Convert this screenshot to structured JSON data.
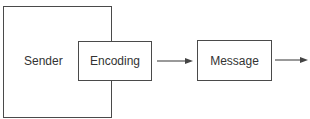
{
  "diagram": {
    "nodes": [
      {
        "id": "sender",
        "label": "Sender"
      },
      {
        "id": "encoding",
        "label": "Encoding"
      },
      {
        "id": "message",
        "label": "Message"
      }
    ],
    "edges": [
      {
        "from": "encoding",
        "to": "message"
      },
      {
        "from": "message",
        "to": "next"
      }
    ],
    "colors": {
      "stroke": "#4a4a4a",
      "text": "#333333",
      "background": "#ffffff"
    }
  }
}
